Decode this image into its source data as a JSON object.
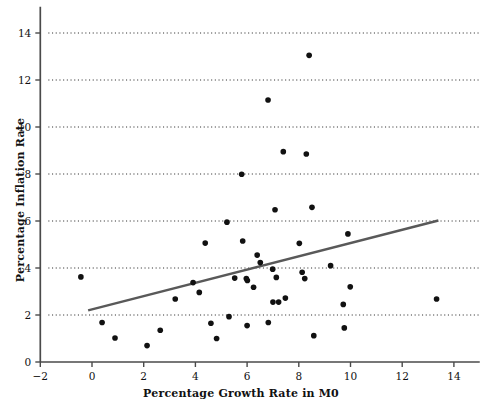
{
  "chart_data": {
    "type": "scatter",
    "title": "",
    "xlabel": "Percentage Growth Rate in M0",
    "ylabel": "Percentage Inflation Rate",
    "xlim": [
      -2,
      15
    ],
    "ylim": [
      0,
      14.9
    ],
    "xticks": [
      -2,
      0,
      2,
      4,
      6,
      8,
      10,
      12,
      14
    ],
    "xticklabels": [
      "−2",
      "0",
      "2",
      "4",
      "6",
      "8",
      "10",
      "12",
      "14"
    ],
    "yticks": [
      0,
      2,
      4,
      6,
      8,
      10,
      12,
      14
    ],
    "yticklabels": [
      "0",
      "2",
      "4",
      "6",
      "8",
      "10",
      "12",
      "14"
    ],
    "grid": {
      "horizontal": true,
      "vertical": false,
      "style": "dotted",
      "color": "#333333",
      "at": [
        2,
        4,
        6,
        8,
        10,
        12,
        14
      ]
    },
    "legend": null,
    "marker": {
      "shape": "circle",
      "color": "#111111",
      "size": 4.1
    },
    "points": [
      {
        "x": -0.43,
        "y": 3.62
      },
      {
        "x": 0.39,
        "y": 1.68
      },
      {
        "x": 0.89,
        "y": 1.02
      },
      {
        "x": 2.13,
        "y": 0.7
      },
      {
        "x": 2.64,
        "y": 1.35
      },
      {
        "x": 3.22,
        "y": 2.68
      },
      {
        "x": 3.91,
        "y": 3.38
      },
      {
        "x": 4.15,
        "y": 2.96
      },
      {
        "x": 4.38,
        "y": 5.06
      },
      {
        "x": 4.6,
        "y": 1.65
      },
      {
        "x": 4.82,
        "y": 1.0
      },
      {
        "x": 5.22,
        "y": 5.95
      },
      {
        "x": 5.3,
        "y": 1.93
      },
      {
        "x": 5.52,
        "y": 3.57
      },
      {
        "x": 5.79,
        "y": 7.99
      },
      {
        "x": 5.83,
        "y": 5.15
      },
      {
        "x": 5.97,
        "y": 3.55
      },
      {
        "x": 6.0,
        "y": 1.55
      },
      {
        "x": 6.01,
        "y": 3.47
      },
      {
        "x": 6.25,
        "y": 3.18
      },
      {
        "x": 6.39,
        "y": 4.55
      },
      {
        "x": 6.51,
        "y": 4.23
      },
      {
        "x": 6.81,
        "y": 11.15
      },
      {
        "x": 6.82,
        "y": 1.68
      },
      {
        "x": 6.99,
        "y": 3.95
      },
      {
        "x": 7.0,
        "y": 2.55
      },
      {
        "x": 7.08,
        "y": 6.48
      },
      {
        "x": 7.13,
        "y": 3.6
      },
      {
        "x": 7.22,
        "y": 2.55
      },
      {
        "x": 7.4,
        "y": 8.95
      },
      {
        "x": 7.48,
        "y": 2.72
      },
      {
        "x": 8.02,
        "y": 5.05
      },
      {
        "x": 8.13,
        "y": 3.82
      },
      {
        "x": 8.23,
        "y": 3.55
      },
      {
        "x": 8.29,
        "y": 8.85
      },
      {
        "x": 8.4,
        "y": 13.05
      },
      {
        "x": 8.51,
        "y": 6.58
      },
      {
        "x": 8.58,
        "y": 1.12
      },
      {
        "x": 9.23,
        "y": 4.1
      },
      {
        "x": 9.72,
        "y": 2.45
      },
      {
        "x": 9.76,
        "y": 1.45
      },
      {
        "x": 9.9,
        "y": 5.45
      },
      {
        "x": 9.99,
        "y": 3.2
      },
      {
        "x": 13.33,
        "y": 2.68
      }
    ],
    "trendline": {
      "type": "linear-fit",
      "color": "#595959",
      "width": 2.4,
      "x_start": -0.15,
      "y_start": 2.2,
      "x_end": 13.4,
      "y_end": 6.02
    }
  },
  "axes": {
    "line_color": "#4a4a4a",
    "background": "#ffffff"
  }
}
